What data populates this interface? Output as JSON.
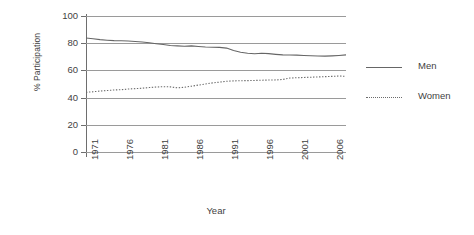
{
  "chart_data": {
    "type": "line",
    "title": "",
    "xlabel": "Year",
    "ylabel": "% Participation",
    "xlim": [
      1971,
      2008
    ],
    "ylim": [
      0,
      100
    ],
    "grid": true,
    "legend_position": "right",
    "y_ticks": [
      100,
      80,
      60,
      40,
      20,
      0
    ],
    "x_ticks": [
      1971,
      1976,
      1981,
      1986,
      1991,
      1996,
      2001,
      2006
    ],
    "x": [
      1971,
      1972,
      1973,
      1974,
      1975,
      1976,
      1977,
      1978,
      1979,
      1980,
      1981,
      1982,
      1983,
      1984,
      1985,
      1986,
      1987,
      1988,
      1989,
      1990,
      1991,
      1992,
      1993,
      1994,
      1995,
      1996,
      1997,
      1998,
      1999,
      2000,
      2001,
      2002,
      2003,
      2004,
      2005,
      2006,
      2007,
      2008
    ],
    "series": [
      {
        "name": "Men",
        "style": "solid",
        "color": "#666666",
        "values": [
          83.8,
          83.3,
          82.6,
          82.2,
          81.9,
          81.8,
          81.6,
          81.3,
          80.9,
          80.3,
          79.6,
          79.0,
          78.3,
          78.0,
          77.8,
          78.0,
          77.6,
          77.2,
          77.0,
          76.9,
          76.4,
          74.6,
          73.3,
          72.6,
          72.2,
          72.6,
          72.3,
          71.8,
          71.4,
          71.3,
          71.2,
          71.0,
          70.8,
          70.6,
          70.5,
          70.7,
          71.0,
          71.4
        ]
      },
      {
        "name": "Women",
        "style": "dotted",
        "color": "#6b6b6b",
        "values": [
          43.9,
          44.3,
          44.8,
          45.2,
          45.6,
          45.8,
          46.3,
          46.6,
          46.9,
          47.4,
          47.8,
          48.0,
          47.9,
          47.2,
          47.6,
          48.4,
          49.2,
          50.0,
          50.8,
          51.4,
          52.0,
          52.3,
          52.4,
          52.5,
          52.6,
          52.8,
          52.9,
          53.0,
          53.3,
          54.4,
          54.6,
          54.8,
          55.0,
          55.2,
          55.4,
          55.6,
          55.9,
          55.6
        ]
      }
    ]
  },
  "axes": {
    "y_title": "% Participation",
    "x_title": "Year",
    "y_tick_labels": [
      "100",
      "80",
      "60",
      "40",
      "20",
      "0"
    ],
    "x_tick_labels": [
      "1971",
      "1976",
      "1981",
      "1986",
      "1991",
      "1996",
      "2001",
      "2006"
    ]
  },
  "legend": {
    "items": [
      {
        "label": "Men",
        "style": "solid"
      },
      {
        "label": "Women",
        "style": "dotted"
      }
    ]
  },
  "colors": {
    "men_line": "#666666",
    "women_line": "#6b6b6b",
    "gridline": "#9a9a9a",
    "axis": "#6e6e6e",
    "text": "#3f3f3f",
    "background": "#ffffff"
  }
}
